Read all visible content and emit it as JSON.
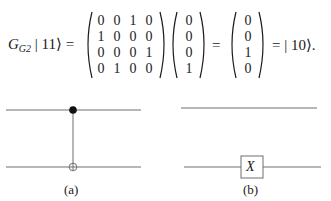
{
  "equation": {
    "lhs_operator": "G",
    "lhs_subscript": "G2",
    "lhs_ket": "| 11⟩",
    "equals": "=",
    "matrix": [
      [
        "0",
        "0",
        "1",
        "0"
      ],
      [
        "1",
        "0",
        "0",
        "0"
      ],
      [
        "0",
        "0",
        "0",
        "1"
      ],
      [
        "0",
        "1",
        "0",
        "0"
      ]
    ],
    "input_vector": [
      "0",
      "0",
      "0",
      "1"
    ],
    "output_vector": [
      "0",
      "0",
      "1",
      "0"
    ],
    "result_ket": "| 10⟩.",
    "equals2": "=",
    "equals3": "="
  },
  "circuits": {
    "a": {
      "label": "(a)",
      "control_symbol": "filled-dot",
      "target_symbol": "oplus"
    },
    "b": {
      "label": "(b)",
      "gate_label": "X"
    }
  },
  "colors": {
    "ink": "#1a1a1a",
    "wire": "#6e6e6e",
    "background": "#ffffff"
  }
}
